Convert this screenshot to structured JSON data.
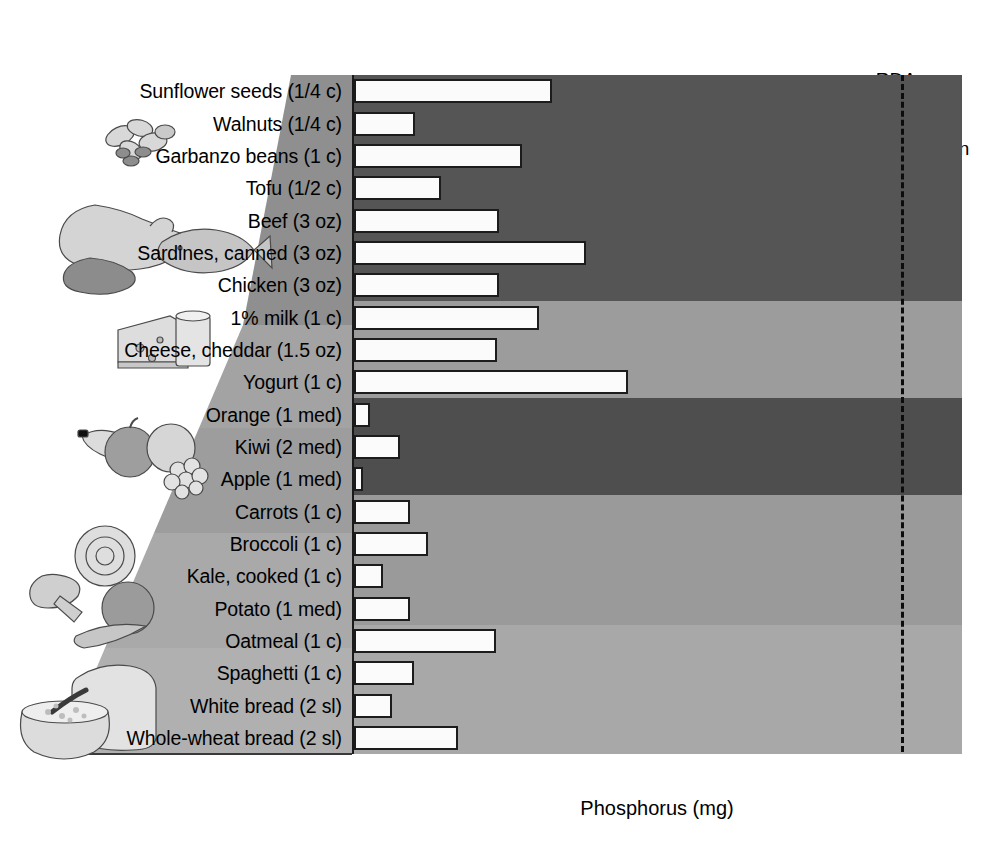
{
  "annotation": {
    "rda_line1": "RDA",
    "rda_line2": "Men and Women",
    "rda_value": 700
  },
  "axis": {
    "x_title": "Phosphorus (mg)",
    "x_ticks": [
      0,
      100,
      200,
      300,
      400,
      500,
      600,
      700
    ],
    "x_min": 0,
    "x_max": 780
  },
  "icons": {
    "nuts_beans": "nuts-and-beans-icon",
    "meat_fish": "meat-and-fish-icon",
    "dairy": "cheese-and-milk-icon",
    "fruit": "fruit-icon",
    "vegetables": "vegetables-icon",
    "grains": "bread-and-cereal-icon"
  },
  "colors": {
    "band_1": "#555555",
    "band_2": "#9c9c9c",
    "band_3": "#4e4e4e",
    "band_4": "#9a9a9a",
    "band_5": "#a8a8a8",
    "bar_fill": "#fbfbfb",
    "bar_stroke": "#1c1c1c",
    "axis": "#1a1a1a",
    "rda_line": "#0c0c0c"
  },
  "chart_data": {
    "type": "bar",
    "orientation": "horizontal",
    "title": "",
    "xlabel": "Phosphorus (mg)",
    "ylabel": "",
    "xlim": [
      0,
      780
    ],
    "grid": false,
    "legend": "none",
    "annotations": [
      {
        "label": "RDA Men and Women",
        "x": 700,
        "style": "dashed-vertical-line"
      }
    ],
    "groups": [
      {
        "name": "Nuts, Beans and Soy",
        "band": 1,
        "count": 4
      },
      {
        "name": "Meat and Fish",
        "band": 1,
        "count": 3
      },
      {
        "name": "Dairy",
        "band": 2,
        "count": 3
      },
      {
        "name": "Fruit",
        "band": 3,
        "count": 3
      },
      {
        "name": "Vegetables",
        "band": 4,
        "count": 4
      },
      {
        "name": "Grains",
        "band": 5,
        "count": 4
      }
    ],
    "categories": [
      "Sunflower seeds (1/4 c)",
      "Walnuts (1/4 c)",
      "Garbanzo beans (1 c)",
      "Tofu (1/2 c)",
      "Beef (3 oz)",
      "Sardines, canned (3 oz)",
      "Chicken (3 oz)",
      "1% milk (1 c)",
      "Cheese, cheddar (1.5 oz)",
      "Yogurt (1 c)",
      "Orange (1 med)",
      "Kiwi (2 med)",
      "Apple (1 med)",
      "Carrots (1 c)",
      "Broccoli (1 c)",
      "Kale, cooked (1 c)",
      "Potato (1 med)",
      "Oatmeal (1 c)",
      "Spaghetti (1 c)",
      "White bread (2 sl)",
      "Whole-wheat bread (2 sl)"
    ],
    "values": [
      253,
      78,
      215,
      111,
      186,
      297,
      185,
      236,
      183,
      350,
      20,
      59,
      11,
      72,
      95,
      37,
      72,
      182,
      77,
      49,
      133
    ]
  }
}
